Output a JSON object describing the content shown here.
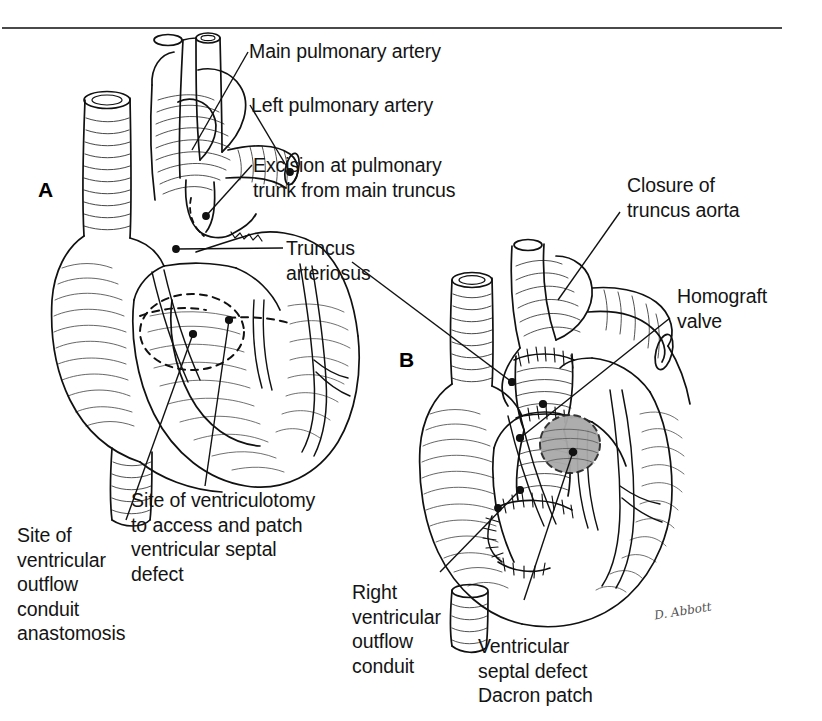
{
  "figure": {
    "domain": "medical-illustration",
    "panels": [
      {
        "id": "A",
        "label": "A"
      },
      {
        "id": "B",
        "label": "B"
      }
    ],
    "signature": "D. Abbott"
  },
  "colors": {
    "ink": "#111111",
    "rule": "#4a4a4a",
    "patch_fill": "#a9a9a9",
    "patch_stroke": "#2a2a2a",
    "paper": "#ffffff"
  },
  "callouts": [
    {
      "id": "main-pulmonary-artery",
      "text": "Main pulmonary artery",
      "panel": "A"
    },
    {
      "id": "left-pulmonary-artery",
      "text": "Left pulmonary artery",
      "panel": "A"
    },
    {
      "id": "excision-pulmonary-trunk",
      "text": "Excision at pulmonary\ntrunk from main truncus",
      "panel": "A"
    },
    {
      "id": "truncus-arteriosus",
      "text": "Truncus\narteriosus",
      "panel": "A"
    },
    {
      "id": "site-outflow-conduit",
      "text": "Site of\nventricular\noutflow\nconduit\nanastomosis",
      "panel": "A"
    },
    {
      "id": "site-ventriculotomy",
      "text": "Site of ventriculotomy\nto access and patch\nventricular septal\ndefect",
      "panel": "A"
    },
    {
      "id": "closure-truncus-aorta",
      "text": "Closure of\ntruncus aorta",
      "panel": "B"
    },
    {
      "id": "homograft-valve",
      "text": "Homograft\nvalve",
      "panel": "B"
    },
    {
      "id": "right-ventricular-conduit",
      "text": "Right\nventricular\noutflow\nconduit",
      "panel": "B"
    },
    {
      "id": "vsd-dacron-patch",
      "text": "Ventricular\nseptal defect\nDacron patch",
      "panel": "B"
    }
  ]
}
